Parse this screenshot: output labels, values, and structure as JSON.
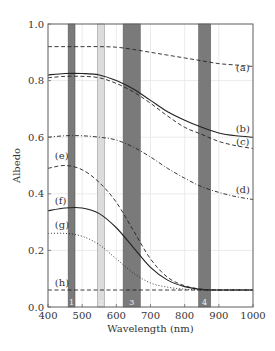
{
  "chart_data": {
    "type": "line",
    "title": "",
    "xlabel": "Wavelength (nm)",
    "ylabel": "Albedo",
    "xlim": [
      400,
      1000
    ],
    "ylim": [
      0.0,
      1.0
    ],
    "grid": true,
    "xticks": [
      400,
      500,
      600,
      700,
      800,
      900,
      1000
    ],
    "xtick_labels": [
      "400",
      "500",
      "600",
      "700",
      "800",
      "900",
      "1000"
    ],
    "yticks": [
      0.0,
      0.2,
      0.4,
      0.6,
      0.8,
      1.0
    ],
    "ytick_labels": [
      "0.0",
      "0.2",
      "0.4",
      "0.6",
      "0.8",
      "1.0"
    ],
    "bands": [
      {
        "label": "1",
        "start": 459,
        "end": 479,
        "shade": "dark"
      },
      {
        "label": "2",
        "start": 545,
        "end": 565,
        "shade": "light"
      },
      {
        "label": "3",
        "start": 620,
        "end": 670,
        "shade": "dark"
      },
      {
        "label": "4",
        "start": 841,
        "end": 876,
        "shade": "dark"
      }
    ],
    "x": [
      400,
      450,
      500,
      550,
      600,
      650,
      700,
      750,
      800,
      850,
      900,
      950,
      1000
    ],
    "series": [
      {
        "name": "(a)",
        "style": "dashed",
        "values": [
          0.92,
          0.92,
          0.92,
          0.92,
          0.918,
          0.91,
          0.9,
          0.89,
          0.88,
          0.87,
          0.86,
          0.855,
          0.85
        ]
      },
      {
        "name": "(b)",
        "style": "solid",
        "values": [
          0.82,
          0.825,
          0.825,
          0.82,
          0.8,
          0.77,
          0.73,
          0.69,
          0.66,
          0.635,
          0.615,
          0.605,
          0.6
        ]
      },
      {
        "name": "(c)",
        "style": "dashed",
        "values": [
          0.81,
          0.815,
          0.815,
          0.81,
          0.79,
          0.76,
          0.72,
          0.675,
          0.635,
          0.61,
          0.585,
          0.57,
          0.56
        ]
      },
      {
        "name": "(d)",
        "style": "dashdot",
        "values": [
          0.6,
          0.605,
          0.605,
          0.6,
          0.59,
          0.565,
          0.53,
          0.49,
          0.455,
          0.425,
          0.405,
          0.39,
          0.38
        ]
      },
      {
        "name": "(e)",
        "style": "dashed",
        "values": [
          0.49,
          0.5,
          0.485,
          0.44,
          0.37,
          0.27,
          0.17,
          0.105,
          0.075,
          0.063,
          0.06,
          0.06,
          0.06
        ]
      },
      {
        "name": "(f)",
        "style": "solid",
        "values": [
          0.34,
          0.35,
          0.35,
          0.33,
          0.28,
          0.21,
          0.14,
          0.095,
          0.072,
          0.062,
          0.06,
          0.06,
          0.06
        ]
      },
      {
        "name": "(g)",
        "style": "dotted",
        "values": [
          0.26,
          0.26,
          0.25,
          0.22,
          0.17,
          0.12,
          0.085,
          0.07,
          0.063,
          0.06,
          0.06,
          0.06,
          0.06
        ]
      },
      {
        "name": "(h)",
        "style": "dashed",
        "values": [
          0.06,
          0.06,
          0.06,
          0.06,
          0.06,
          0.06,
          0.06,
          0.06,
          0.06,
          0.06,
          0.06,
          0.06,
          0.06
        ]
      }
    ],
    "label_positions": [
      {
        "name": "(a)",
        "x": 970,
        "y": 0.845,
        "anchor": "right"
      },
      {
        "name": "(b)",
        "x": 970,
        "y": 0.63,
        "anchor": "right"
      },
      {
        "name": "(c)",
        "x": 970,
        "y": 0.585,
        "anchor": "right"
      },
      {
        "name": "(d)",
        "x": 970,
        "y": 0.415,
        "anchor": "right"
      },
      {
        "name": "(e)",
        "x": 420,
        "y": 0.535,
        "anchor": "left"
      },
      {
        "name": "(f)",
        "x": 420,
        "y": 0.375,
        "anchor": "left"
      },
      {
        "name": "(g)",
        "x": 420,
        "y": 0.29,
        "anchor": "left"
      },
      {
        "name": "(h)",
        "x": 420,
        "y": 0.085,
        "anchor": "left"
      }
    ],
    "colors": {
      "line": "#222222",
      "band_dark": "#7a7a7a",
      "band_light": "#dcdcdc",
      "grid": "#e6e6e6",
      "frame": "#666666"
    }
  }
}
